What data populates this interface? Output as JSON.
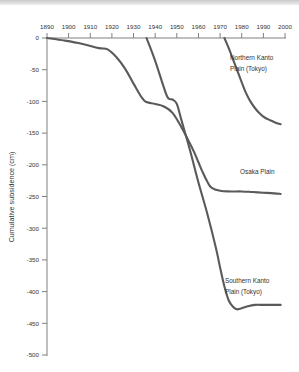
{
  "chart_data": {
    "type": "line",
    "title": "",
    "xlabel": "",
    "ylabel": "Cumulative subsidence (cm)",
    "xlim": [
      1890,
      2000
    ],
    "ylim": [
      -500,
      0
    ],
    "xticks": [
      1890,
      1900,
      1910,
      1920,
      1930,
      1940,
      1950,
      1960,
      1970,
      1980,
      1990,
      2000
    ],
    "xticklabels": [
      "1890",
      "1900",
      "1910",
      "1920",
      "1930",
      "1940",
      "1950",
      "1960",
      "1970",
      "1980",
      "1990",
      "2000"
    ],
    "yticks": [
      0,
      -50,
      -100,
      -150,
      -200,
      -250,
      -300,
      -350,
      -400,
      -450,
      -500
    ],
    "yticklabels": [
      "0",
      "-50",
      "-100",
      "-150",
      "-200",
      "-250",
      "-300",
      "-350",
      "-400",
      "-450",
      "-500"
    ],
    "grid": false,
    "legend_position": "inline-annotations",
    "line_color": "#5a5a5a",
    "axis_color": "#808080",
    "series": [
      {
        "name": "Osaka Plain",
        "label": "Osaka Plain",
        "label_x": 1966,
        "label_y": -209,
        "x": [
          1890,
          1898,
          1906,
          1914,
          1918,
          1922,
          1926,
          1930,
          1934,
          1936,
          1940,
          1944,
          1948,
          1952,
          1956,
          1958,
          1960,
          1962,
          1964,
          1966,
          1970,
          1975,
          1980,
          1985,
          1990,
          1995,
          1998
        ],
        "values": [
          0,
          -4,
          -9,
          -16,
          -18,
          -30,
          -48,
          -72,
          -95,
          -101,
          -104,
          -108,
          -118,
          -140,
          -166,
          -180,
          -196,
          -212,
          -226,
          -236,
          -241,
          -242,
          -242,
          -243,
          -244,
          -245,
          -246
        ]
      },
      {
        "name": "Southern Kanto Plain (Tokyo)",
        "label": "Southern Kanto\nPlain (Tokyo)",
        "label_x": 1963,
        "label_y": -398,
        "x": [
          1936,
          1940,
          1944,
          1946,
          1948,
          1950,
          1952,
          1956,
          1960,
          1964,
          1968,
          1970,
          1972,
          1974,
          1976,
          1978,
          1982,
          1986,
          1990,
          1994,
          1998
        ],
        "values": [
          0,
          -36,
          -78,
          -95,
          -97,
          -104,
          -128,
          -176,
          -228,
          -276,
          -330,
          -362,
          -392,
          -414,
          -424,
          -428,
          -424,
          -421,
          -421,
          -421,
          -421
        ]
      },
      {
        "name": "Northern Kanto Plain (Tokyo)",
        "label": "Northern Kanto\nPlain (Tokyo)",
        "label_x": 1973,
        "label_y": -36,
        "x": [
          1972,
          1974,
          1976,
          1978,
          1980,
          1982,
          1984,
          1986,
          1988,
          1990,
          1992,
          1994,
          1996,
          1998
        ],
        "values": [
          0,
          -16,
          -34,
          -52,
          -70,
          -87,
          -100,
          -110,
          -118,
          -124,
          -128,
          -131,
          -134,
          -136
        ]
      }
    ]
  },
  "annotations": {
    "northern_line1": "Northern Kanto",
    "northern_line2": "Plain (Tokyo)",
    "osaka_line1": "Osaka Plain",
    "southern_line1": "Southern Kanto",
    "southern_line2": "Plain (Tokyo)"
  },
  "axis": {
    "y_title": "Cumulative subsidence (cm)"
  }
}
